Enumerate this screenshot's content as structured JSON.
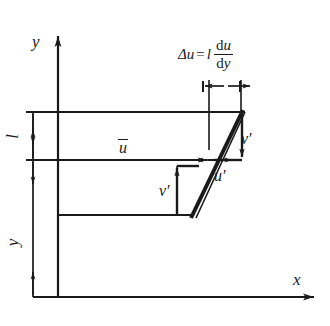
{
  "figure": {
    "background_color": "#ffffff",
    "line_color": "#1a1a1a",
    "axes": {
      "x_label": "x",
      "y_label": "y"
    },
    "labels": {
      "mixing_length": "l",
      "wall_distance": "y",
      "mean_velocity": "u",
      "u_fluctuation": "u",
      "v_fluctuation_upper": "v",
      "v_fluctuation_lower": "v",
      "prime": "′"
    },
    "formula": {
      "delta": "Δ",
      "lhs_var": "u",
      "equals": "=",
      "mixing_length": "l",
      "numerator_d": "d",
      "numerator_var": "u",
      "denominator_d": "d",
      "denominator_var": "y",
      "full_text": "Δu = l du/dy"
    },
    "geometry": {
      "y_axis_x": 58,
      "y_axis_top": 30,
      "x_axis_y": 297,
      "x_axis_right": 320,
      "dimension_line_x": 33,
      "top_line_y": 112,
      "mid_line_y": 160,
      "bottom_line_y": 215,
      "profile_bottom_x": 192,
      "profile_top_x": 242,
      "delta_u_line_y": 86,
      "delta_u_left_x": 203,
      "delta_u_right_x": 248
    }
  }
}
